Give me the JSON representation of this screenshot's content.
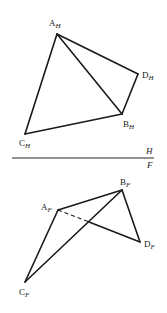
{
  "diagram": {
    "type": "orthographic-projection",
    "fold_line": {
      "upper_plane": "H",
      "lower_plane": "F"
    },
    "top_view": {
      "plane": "H",
      "vertices": [
        {
          "id": "A",
          "label": "A",
          "subscript": "H"
        },
        {
          "id": "B",
          "label": "B",
          "subscript": "H"
        },
        {
          "id": "C",
          "label": "C",
          "subscript": "H"
        },
        {
          "id": "D",
          "label": "D",
          "subscript": "H"
        }
      ],
      "edges": [
        {
          "from": "A",
          "to": "D",
          "style": "solid"
        },
        {
          "from": "D",
          "to": "B",
          "style": "solid"
        },
        {
          "from": "B",
          "to": "C",
          "style": "solid"
        },
        {
          "from": "C",
          "to": "A",
          "style": "solid"
        },
        {
          "from": "A",
          "to": "B",
          "style": "solid"
        }
      ]
    },
    "front_view": {
      "plane": "F",
      "vertices": [
        {
          "id": "A",
          "label": "A",
          "subscript": "F"
        },
        {
          "id": "B",
          "label": "B",
          "subscript": "F"
        },
        {
          "id": "C",
          "label": "C",
          "subscript": "F"
        },
        {
          "id": "D",
          "label": "D",
          "subscript": "F"
        }
      ],
      "edges": [
        {
          "from": "A",
          "to": "B",
          "style": "solid"
        },
        {
          "from": "B",
          "to": "D",
          "style": "solid"
        },
        {
          "from": "A",
          "to": "C",
          "style": "solid"
        },
        {
          "from": "C",
          "to": "B",
          "style": "solid"
        },
        {
          "from": "A",
          "to": "D",
          "style": "partially-hidden (dashed from A to crossing, solid to D)"
        }
      ]
    }
  }
}
